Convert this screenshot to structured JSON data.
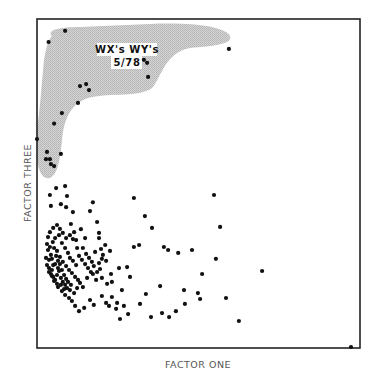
{
  "chart_data": {
    "type": "scatter",
    "title": "",
    "xlabel": "FACTOR ONE",
    "ylabel": "FACTOR THREE",
    "xlim": [
      0,
      100
    ],
    "ylim": [
      0,
      100
    ],
    "grid": false,
    "ticks": false,
    "legend": null,
    "annotation": {
      "lines": [
        "WX's WY's",
        "5/78"
      ],
      "region": "shaded cluster in upper-left area"
    },
    "highlight_region_color": "#c8c8c8",
    "point_color": "#111111",
    "series": [
      {
        "name": "highlighted (WX's WY's 5/78)",
        "points": [
          [
            8.7,
            96.4
          ],
          [
            3.6,
            93.0
          ],
          [
            59.4,
            90.9
          ],
          [
            34.1,
            86.7
          ],
          [
            33.1,
            87.6
          ],
          [
            15.2,
            80.2
          ],
          [
            13.3,
            79.6
          ],
          [
            16.1,
            78.4
          ],
          [
            12.7,
            74.5
          ],
          [
            34.4,
            82.4
          ],
          [
            7.7,
            71.4
          ],
          [
            5.3,
            68.2
          ],
          [
            0.0,
            63.5
          ],
          [
            3.1,
            59.6
          ],
          [
            2.8,
            57.4
          ],
          [
            4.0,
            57.4
          ],
          [
            7.4,
            59.0
          ],
          [
            5.3,
            55.3
          ],
          [
            4.3,
            55.9
          ]
        ]
      },
      {
        "name": "other",
        "points": [
          [
            5.9,
            48.6
          ],
          [
            8.7,
            49.2
          ],
          [
            4.0,
            46.5
          ],
          [
            9.3,
            46.2
          ],
          [
            4.3,
            43.2
          ],
          [
            7.4,
            43.7
          ],
          [
            9.0,
            42.8
          ],
          [
            11.1,
            41.3
          ],
          [
            16.4,
            41.6
          ],
          [
            30.0,
            45.6
          ],
          [
            54.8,
            46.5
          ],
          [
            17.3,
            44.3
          ],
          [
            18.6,
            38.3
          ],
          [
            19.2,
            35.0
          ],
          [
            19.2,
            33.4
          ],
          [
            14.9,
            33.4
          ],
          [
            13.6,
            36.1
          ],
          [
            10.5,
            37.7
          ],
          [
            11.5,
            35.2
          ],
          [
            12.1,
            32.8
          ],
          [
            3.1,
            31.6
          ],
          [
            2.8,
            27.4
          ],
          [
            4.3,
            28.3
          ],
          [
            3.7,
            26.8
          ],
          [
            5.0,
            25.2
          ],
          [
            4.6,
            23.7
          ],
          [
            3.7,
            23.1
          ],
          [
            4.6,
            21.9
          ],
          [
            5.3,
            20.4
          ],
          [
            6.2,
            19.5
          ],
          [
            6.5,
            18.5
          ],
          [
            7.7,
            17.3
          ],
          [
            8.7,
            16.1
          ],
          [
            9.9,
            15.2
          ],
          [
            10.8,
            14.3
          ],
          [
            11.5,
            16.7
          ],
          [
            12.4,
            18.2
          ],
          [
            13.3,
            19.8
          ],
          [
            14.2,
            18.5
          ],
          [
            15.5,
            21.3
          ],
          [
            17.3,
            22.5
          ],
          [
            18.3,
            20.7
          ],
          [
            19.5,
            24.0
          ],
          [
            20.1,
            27.1
          ],
          [
            21.4,
            26.5
          ],
          [
            22.9,
            22.5
          ],
          [
            25.4,
            24.3
          ],
          [
            27.9,
            24.6
          ],
          [
            28.8,
            21.6
          ],
          [
            26.3,
            17.6
          ],
          [
            24.8,
            13.7
          ],
          [
            22.3,
            12.8
          ],
          [
            28.2,
            10.3
          ],
          [
            25.7,
            8.8
          ],
          [
            31.9,
            13.4
          ],
          [
            35.3,
            9.4
          ],
          [
            33.7,
            16.4
          ],
          [
            30.0,
            30.7
          ],
          [
            31.6,
            31.3
          ],
          [
            39.3,
            30.7
          ],
          [
            40.6,
            29.8
          ],
          [
            43.7,
            28.9
          ],
          [
            48.0,
            29.8
          ],
          [
            55.4,
            27.1
          ],
          [
            56.7,
            36.8
          ],
          [
            33.4,
            40.1
          ],
          [
            35.6,
            36.5
          ],
          [
            45.5,
            17.6
          ],
          [
            43.0,
            11.2
          ],
          [
            45.8,
            13.4
          ],
          [
            50.5,
            14.9
          ],
          [
            49.8,
            16.7
          ],
          [
            38.7,
            10.6
          ],
          [
            38.1,
            18.8
          ],
          [
            62.5,
            8.2
          ],
          [
            69.7,
            23.4
          ],
          [
            58.5,
            15.2
          ],
          [
            51.1,
            22.5
          ],
          [
            40.9,
            9.4
          ],
          [
            97.2,
            0.3
          ],
          [
            5.6,
            33.4
          ],
          [
            6.8,
            34.3
          ],
          [
            7.7,
            31.9
          ],
          [
            8.7,
            30.4
          ],
          [
            9.6,
            28.9
          ],
          [
            10.2,
            27.4
          ],
          [
            11.1,
            26.5
          ],
          [
            12.1,
            25.2
          ],
          [
            6.2,
            29.5
          ],
          [
            7.1,
            27.7
          ],
          [
            8.0,
            26.2
          ],
          [
            9.0,
            24.9
          ],
          [
            9.9,
            23.7
          ],
          [
            10.8,
            22.8
          ],
          [
            11.8,
            21.6
          ],
          [
            12.7,
            20.7
          ],
          [
            3.4,
            29.8
          ],
          [
            4.0,
            30.7
          ],
          [
            4.9,
            32.2
          ],
          [
            5.3,
            30.4
          ],
          [
            5.9,
            28.0
          ],
          [
            6.5,
            26.5
          ],
          [
            7.1,
            25.5
          ],
          [
            7.7,
            23.7
          ],
          [
            8.4,
            22.2
          ],
          [
            9.0,
            21.0
          ],
          [
            9.6,
            20.1
          ],
          [
            10.5,
            19.2
          ],
          [
            3.1,
            25.2
          ],
          [
            3.7,
            24.3
          ],
          [
            4.3,
            22.5
          ],
          [
            5.0,
            21.6
          ],
          [
            5.6,
            20.7
          ],
          [
            6.2,
            22.2
          ],
          [
            6.8,
            23.4
          ],
          [
            7.4,
            21.3
          ],
          [
            8.0,
            20.1
          ],
          [
            8.7,
            19.2
          ],
          [
            9.3,
            18.2
          ],
          [
            10.2,
            17.6
          ],
          [
            13.0,
            28.0
          ],
          [
            13.9,
            26.8
          ],
          [
            14.9,
            25.5
          ],
          [
            15.8,
            24.3
          ],
          [
            16.7,
            23.1
          ],
          [
            14.2,
            30.4
          ],
          [
            15.2,
            28.6
          ],
          [
            16.1,
            27.4
          ],
          [
            17.0,
            26.2
          ],
          [
            18.0,
            29.2
          ],
          [
            19.8,
            30.1
          ],
          [
            21.1,
            31.3
          ],
          [
            22.6,
            29.5
          ],
          [
            20.4,
            28.3
          ],
          [
            19.2,
            25.8
          ],
          [
            17.6,
            24.9
          ],
          [
            18.6,
            23.1
          ],
          [
            20.1,
            21.3
          ],
          [
            21.7,
            19.5
          ],
          [
            23.2,
            20.1
          ],
          [
            3.4,
            33.7
          ],
          [
            4.0,
            35.2
          ],
          [
            5.0,
            36.5
          ],
          [
            6.2,
            37.4
          ],
          [
            7.1,
            36.2
          ],
          [
            8.0,
            35.0
          ],
          [
            9.0,
            33.4
          ],
          [
            10.2,
            34.3
          ],
          [
            11.1,
            33.1
          ],
          [
            12.4,
            30.4
          ],
          [
            4.6,
            27.1
          ],
          [
            5.6,
            25.5
          ],
          [
            6.5,
            24.3
          ],
          [
            7.4,
            19.2
          ],
          [
            8.4,
            17.9
          ],
          [
            11.8,
            12.8
          ],
          [
            13.0,
            11.2
          ],
          [
            14.6,
            12.2
          ],
          [
            16.4,
            14.6
          ],
          [
            17.6,
            13.1
          ],
          [
            20.1,
            15.8
          ],
          [
            21.4,
            13.7
          ],
          [
            23.2,
            15.5
          ],
          [
            24.5,
            11.9
          ],
          [
            26.9,
            12.8
          ]
        ]
      }
    ]
  },
  "ui": {
    "x_axis_label": "FACTOR ONE",
    "y_axis_label": "FACTOR THREE",
    "annotation_line1": "WX's WY's",
    "annotation_line2": "5/78"
  }
}
